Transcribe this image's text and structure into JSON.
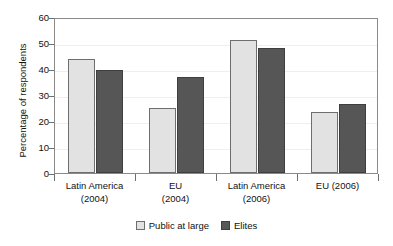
{
  "chart_data": {
    "type": "bar",
    "title": "",
    "xlabel": "",
    "ylabel": "Percentage of respondents",
    "ylim": [
      0,
      60
    ],
    "yticks": [
      0,
      10,
      20,
      30,
      40,
      50,
      60
    ],
    "ytick_labels": [
      "0",
      "10",
      "20",
      "30",
      "40",
      "50",
      "60"
    ],
    "grid": true,
    "legend_position": "bottom-center",
    "categories": [
      "Latin America (2004)",
      "EU (2004)",
      "Latin America (2006)",
      "EU (2006)"
    ],
    "category_lines": [
      [
        "Latin America",
        "(2004)"
      ],
      [
        "EU",
        "(2004)"
      ],
      [
        "Latin America",
        "(2006)"
      ],
      [
        "EU (2006)"
      ]
    ],
    "series": [
      {
        "name": "Public at large",
        "color": "#e2e2e2",
        "values": [
          44,
          25,
          51,
          23.5
        ]
      },
      {
        "name": "Elites",
        "color": "#565656",
        "values": [
          39.5,
          37,
          48,
          26.5
        ]
      }
    ]
  },
  "legend": {
    "items": [
      {
        "label": "Public at large",
        "swatch": "public"
      },
      {
        "label": "Elites",
        "swatch": "elites"
      }
    ]
  }
}
